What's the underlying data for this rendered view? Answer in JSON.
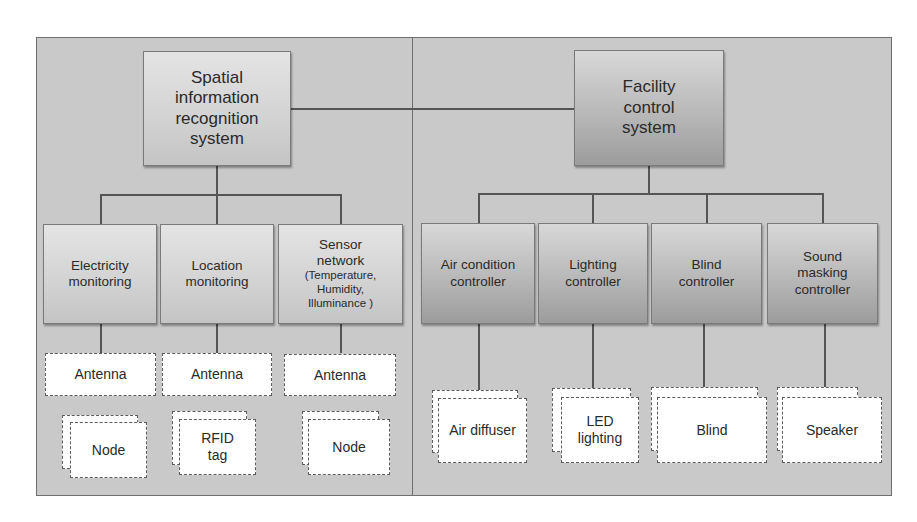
{
  "diagram": {
    "left_panel": {
      "root": {
        "label": "Spatial information recognition system",
        "lines": [
          "Spatial",
          "information",
          "recognition",
          "system"
        ]
      },
      "children": [
        {
          "label": "Electricity monitoring",
          "lines": [
            "Electricity",
            "monitoring"
          ],
          "antenna": "Antenna",
          "device": "Node"
        },
        {
          "label": "Location monitoring",
          "lines": [
            "Location",
            "monitoring"
          ],
          "antenna": "Antenna",
          "device": "RFID tag",
          "device_lines": [
            "RFID",
            "tag"
          ]
        },
        {
          "label": "Sensor network (Temperature, Humidity, Illuminance)",
          "lines": [
            "Sensor",
            "network"
          ],
          "sub_lines": [
            "(Temperature,",
            "Humidity,",
            "Illuminance )"
          ],
          "antenna": "Antenna",
          "device": "Node"
        }
      ]
    },
    "right_panel": {
      "root": {
        "label": "Facility control system",
        "lines": [
          "Facility",
          "control",
          "system"
        ]
      },
      "children": [
        {
          "label": "Air condition controller",
          "lines": [
            "Air condition",
            "controller"
          ],
          "device": "Air diffuser"
        },
        {
          "label": "Lighting controller",
          "lines": [
            "Lighting",
            "controller"
          ],
          "device": "LED lighting",
          "device_lines": [
            "LED",
            "lighting"
          ]
        },
        {
          "label": "Blind controller",
          "lines": [
            "Blind",
            "controller"
          ],
          "device": "Blind"
        },
        {
          "label": "Sound masking controller",
          "lines": [
            "Sound",
            "masking",
            "controller"
          ],
          "device": "Speaker"
        }
      ]
    },
    "connections": [
      {
        "from": "Spatial information recognition system",
        "to": "Facility control system"
      }
    ],
    "colors": {
      "panel_bg": "#c9c9c9",
      "light_box": "#d6d6d6",
      "dark_box": "#a8a8a8",
      "device_box": "#ffffff",
      "line": "#555555"
    }
  }
}
